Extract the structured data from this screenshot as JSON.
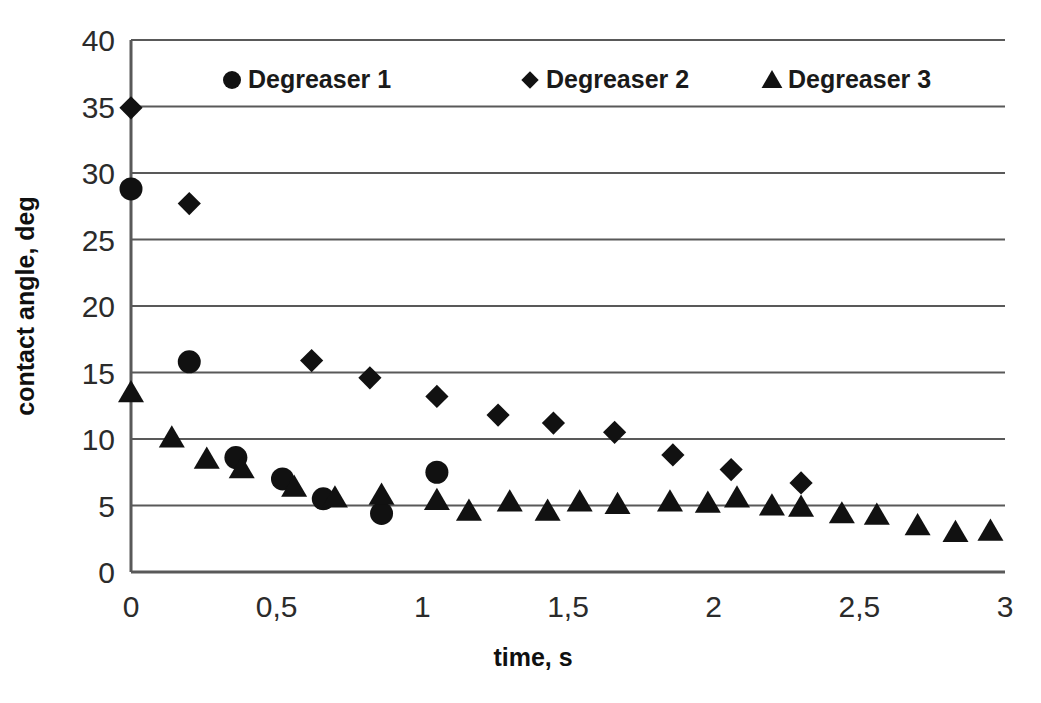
{
  "chart_data": {
    "type": "scatter",
    "title": "",
    "xlabel": "time, s",
    "ylabel": "contact angle, deg",
    "xlim": [
      0,
      3
    ],
    "ylim": [
      0,
      40
    ],
    "xticks": [
      "0",
      "0,5",
      "1",
      "1,5",
      "2",
      "2,5",
      "3"
    ],
    "xtick_values": [
      0,
      0.5,
      1,
      1.5,
      2,
      2.5,
      3
    ],
    "yticks": [
      "0",
      "5",
      "10",
      "15",
      "20",
      "25",
      "30",
      "35",
      "40"
    ],
    "ytick_values": [
      0,
      5,
      10,
      15,
      20,
      25,
      30,
      35,
      40
    ],
    "grid": "horizontal",
    "legend_position": "top-inside",
    "decimal_separator": ",",
    "series": [
      {
        "name": "Degreaser 1",
        "marker": "circle",
        "color": "#111111",
        "points": [
          [
            0.0,
            28.8
          ],
          [
            0.2,
            15.8
          ],
          [
            0.36,
            8.6
          ],
          [
            0.52,
            7.0
          ],
          [
            0.66,
            5.5
          ],
          [
            0.86,
            4.4
          ],
          [
            1.05,
            7.5
          ]
        ]
      },
      {
        "name": "Degreaser 2",
        "marker": "diamond",
        "color": "#111111",
        "points": [
          [
            0.0,
            34.9
          ],
          [
            0.2,
            27.7
          ],
          [
            0.62,
            15.9
          ],
          [
            0.82,
            14.6
          ],
          [
            1.05,
            13.2
          ],
          [
            1.26,
            11.8
          ],
          [
            1.45,
            11.2
          ],
          [
            1.66,
            10.5
          ],
          [
            1.86,
            8.8
          ],
          [
            2.06,
            7.7
          ],
          [
            2.3,
            6.7
          ]
        ]
      },
      {
        "name": "Degreaser 3",
        "marker": "triangle",
        "color": "#111111",
        "points": [
          [
            0.0,
            13.5
          ],
          [
            0.14,
            10.1
          ],
          [
            0.26,
            8.5
          ],
          [
            0.38,
            7.8
          ],
          [
            0.56,
            6.4
          ],
          [
            0.7,
            5.6
          ],
          [
            0.86,
            5.8
          ],
          [
            1.05,
            5.4
          ],
          [
            1.16,
            4.6
          ],
          [
            1.3,
            5.3
          ],
          [
            1.43,
            4.6
          ],
          [
            1.54,
            5.3
          ],
          [
            1.67,
            5.1
          ],
          [
            1.85,
            5.3
          ],
          [
            1.98,
            5.2
          ],
          [
            2.08,
            5.6
          ],
          [
            2.2,
            5.0
          ],
          [
            2.3,
            4.9
          ],
          [
            2.44,
            4.4
          ],
          [
            2.56,
            4.3
          ],
          [
            2.7,
            3.5
          ],
          [
            2.83,
            3.0
          ],
          [
            2.95,
            3.1
          ]
        ]
      }
    ]
  },
  "legend": {
    "items": [
      {
        "label": "Degreaser 1",
        "marker": "circle"
      },
      {
        "label": "Degreaser 2",
        "marker": "diamond"
      },
      {
        "label": "Degreaser 3",
        "marker": "triangle"
      }
    ]
  },
  "axes": {
    "x_title": "time, s",
    "y_title": "contact angle, deg"
  }
}
